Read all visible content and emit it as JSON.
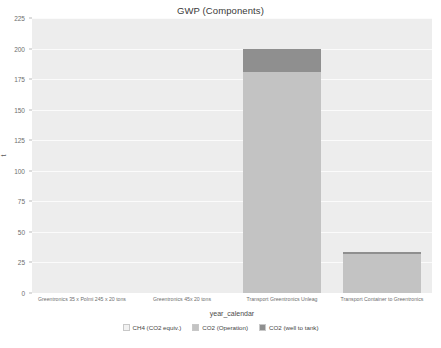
{
  "chart_data": {
    "type": "bar",
    "title": "GWP (Components)",
    "xlabel": "year_calendar",
    "ylabel": "t",
    "ylim": [
      0,
      225
    ],
    "yticks": [
      0,
      25,
      50,
      75,
      100,
      125,
      150,
      175,
      200,
      225
    ],
    "grid": true,
    "stacked": true,
    "legend_position": "bottom",
    "categories": [
      "Greentronics 35 x Polmi 245 x 20 tons",
      "Greentronics 45x 20 tons",
      "Transport Greentronics Unleag",
      "Transport Container to Greentronics"
    ],
    "series": [
      {
        "name": "CH4 (CO2 equiv.)",
        "color": "#f2f2f2",
        "values": [
          0,
          0,
          0,
          0
        ]
      },
      {
        "name": "CO2 (Operation)",
        "color": "#c3c3c3",
        "values": [
          0,
          0,
          181,
          32
        ]
      },
      {
        "name": "CO2 (well to tank)",
        "color": "#8f8f8f",
        "values": [
          0,
          0,
          19,
          1.5
        ]
      }
    ],
    "totals": [
      0,
      0,
      200,
      33.5
    ]
  },
  "colors": {
    "plot_background": "#ededed",
    "gridline": "#fbfbfb",
    "axis_text": "#6e6e6e",
    "title_text": "#3a3a3a"
  }
}
